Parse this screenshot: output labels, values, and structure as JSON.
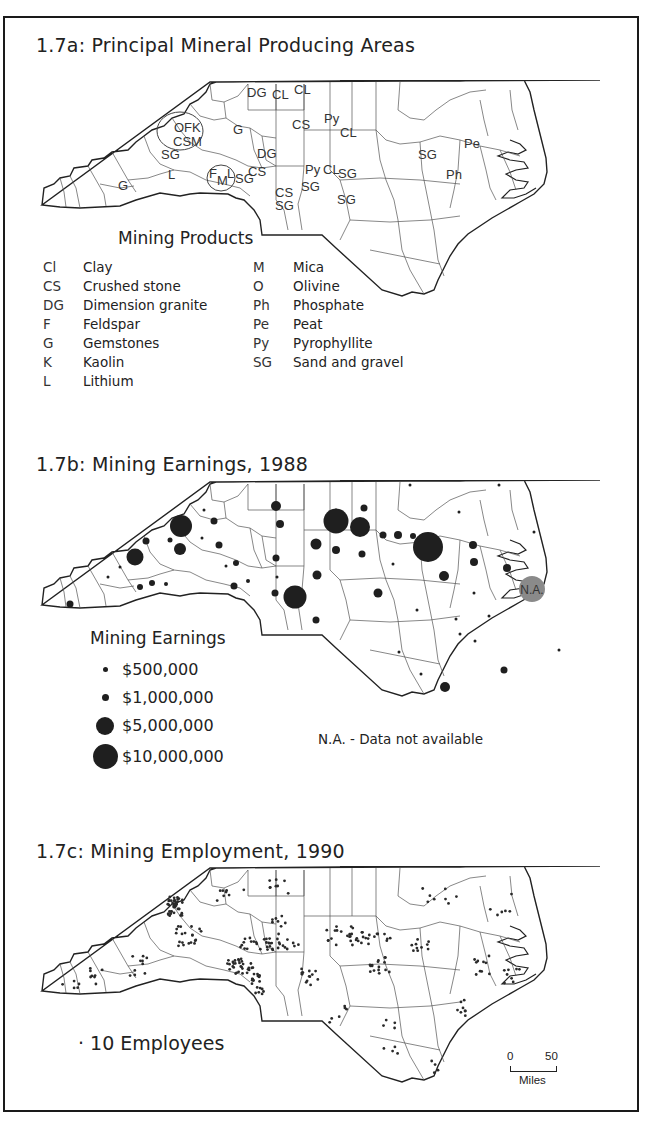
{
  "panels": {
    "a": {
      "title": "1.7a: Principal Mineral Producing Areas",
      "legend_title": "Mining Products",
      "legend_left": [
        {
          "code": "Cl",
          "label": "Clay"
        },
        {
          "code": "CS",
          "label": "Crushed stone"
        },
        {
          "code": "DG",
          "label": "Dimension granite"
        },
        {
          "code": "F",
          "label": "Feldspar"
        },
        {
          "code": "G",
          "label": "Gemstones"
        },
        {
          "code": "K",
          "label": "Kaolin"
        },
        {
          "code": "L",
          "label": "Lithium"
        }
      ],
      "legend_right": [
        {
          "code": "M",
          "label": "Mica"
        },
        {
          "code": "O",
          "label": "Olivine"
        },
        {
          "code": "Ph",
          "label": "Phosphate"
        },
        {
          "code": "Pe",
          "label": "Peat"
        },
        {
          "code": "Py",
          "label": "Pyrophyllite"
        },
        {
          "code": "SG",
          "label": "Sand and gravel"
        }
      ],
      "map_labels": [
        {
          "text": "DG",
          "x": 207,
          "y": 17
        },
        {
          "text": "CL",
          "x": 232,
          "y": 19
        },
        {
          "text": "CL",
          "x": 254,
          "y": 14
        },
        {
          "text": "CS",
          "x": 252,
          "y": 49
        },
        {
          "text": "Py",
          "x": 284,
          "y": 43
        },
        {
          "text": "CL",
          "x": 300,
          "y": 57
        },
        {
          "text": "G",
          "x": 193,
          "y": 54
        },
        {
          "text": "OFK",
          "x": 134,
          "y": 52
        },
        {
          "text": "CSM",
          "x": 133,
          "y": 66
        },
        {
          "text": "SG",
          "x": 121,
          "y": 79
        },
        {
          "text": "DG",
          "x": 217,
          "y": 78
        },
        {
          "text": "L",
          "x": 128,
          "y": 99
        },
        {
          "text": "F",
          "x": 169,
          "y": 98
        },
        {
          "text": "M",
          "x": 177,
          "y": 105
        },
        {
          "text": "L",
          "x": 187,
          "y": 98
        },
        {
          "text": "SG",
          "x": 195,
          "y": 103
        },
        {
          "text": "CS",
          "x": 208,
          "y": 96
        },
        {
          "text": "G",
          "x": 78,
          "y": 110
        },
        {
          "text": "Py",
          "x": 265,
          "y": 94
        },
        {
          "text": "CL",
          "x": 283,
          "y": 94
        },
        {
          "text": "SG",
          "x": 298,
          "y": 98
        },
        {
          "text": "SG",
          "x": 261,
          "y": 111
        },
        {
          "text": "CS",
          "x": 235,
          "y": 117
        },
        {
          "text": "SG",
          "x": 235,
          "y": 130
        },
        {
          "text": "SG",
          "x": 297,
          "y": 124
        },
        {
          "text": "SG",
          "x": 378,
          "y": 79
        },
        {
          "text": "Pe",
          "x": 424,
          "y": 68
        },
        {
          "text": "Ph",
          "x": 406,
          "y": 99
        }
      ]
    },
    "b": {
      "title": "1.7b: Mining Earnings, 1988",
      "legend_title": "Mining Earnings",
      "legend": [
        {
          "label": "$500,000",
          "size": 5
        },
        {
          "label": "$1,000,000",
          "size": 7
        },
        {
          "label": "$5,000,000",
          "size": 18
        },
        {
          "label": "$10,000,000",
          "size": 25
        }
      ],
      "na_label": "N.A.",
      "note": "N.A. - Data not available"
    },
    "c": {
      "title": "1.7c: Mining Employment, 1990",
      "legend": "· 10 Employees",
      "scale": {
        "zero": "0",
        "fifty": "50",
        "unit": "Miles"
      }
    }
  },
  "chart_data": [
    {
      "type": "table",
      "title": "1.7a: Principal Mineral Producing Areas",
      "legend_title": "Mining Products",
      "codes": {
        "Cl": "Clay",
        "CS": "Crushed stone",
        "DG": "Dimension granite",
        "F": "Feldspar",
        "G": "Gemstones",
        "K": "Kaolin",
        "L": "Lithium",
        "M": "Mica",
        "O": "Olivine",
        "Ph": "Phosphate",
        "Pe": "Peat",
        "Py": "Pyrophyllite",
        "SG": "Sand and gravel"
      }
    },
    {
      "type": "scatter",
      "title": "1.7b: Mining Earnings, 1988",
      "legend_title": "Mining Earnings",
      "legend_entries": [
        "$500,000",
        "$1,000,000",
        "$5,000,000",
        "$10,000,000"
      ],
      "annotation": "N.A. - Data not available",
      "points": [
        {
          "x": 30,
          "y": 124,
          "r": 3.5
        },
        {
          "x": 106,
          "y": 61,
          "r": 3.5
        },
        {
          "x": 130,
          "y": 60,
          "r": 2.5
        },
        {
          "x": 100,
          "y": 107,
          "r": 3
        },
        {
          "x": 112,
          "y": 103,
          "r": 3
        },
        {
          "x": 126,
          "y": 104,
          "r": 2
        },
        {
          "x": 80,
          "y": 87,
          "r": 1.5
        },
        {
          "x": 68,
          "y": 97,
          "r": 1.5
        },
        {
          "x": 95,
          "y": 77,
          "r": 8.5
        },
        {
          "x": 141,
          "y": 46,
          "r": 11
        },
        {
          "x": 140,
          "y": 69,
          "r": 6
        },
        {
          "x": 164,
          "y": 30,
          "r": 1.5
        },
        {
          "x": 174,
          "y": 41,
          "r": 3.5
        },
        {
          "x": 162,
          "y": 58,
          "r": 1.5
        },
        {
          "x": 179,
          "y": 65,
          "r": 3.5
        },
        {
          "x": 186,
          "y": 86,
          "r": 1.5
        },
        {
          "x": 196,
          "y": 83,
          "r": 3
        },
        {
          "x": 208,
          "y": 101,
          "r": 2
        },
        {
          "x": 194,
          "y": 106,
          "r": 3.5
        },
        {
          "x": 236,
          "y": 26,
          "r": 5
        },
        {
          "x": 240,
          "y": 44,
          "r": 4
        },
        {
          "x": 236,
          "y": 78,
          "r": 3.5
        },
        {
          "x": 237,
          "y": 97,
          "r": 1.5
        },
        {
          "x": 235,
          "y": 113,
          "r": 3.5
        },
        {
          "x": 255,
          "y": 117,
          "r": 11.5
        },
        {
          "x": 276,
          "y": 64,
          "r": 5.5
        },
        {
          "x": 277,
          "y": 95,
          "r": 4.5
        },
        {
          "x": 276,
          "y": 140,
          "r": 3.5
        },
        {
          "x": 296,
          "y": 30,
          "r": 1.5
        },
        {
          "x": 296,
          "y": 41,
          "r": 12.5
        },
        {
          "x": 320,
          "y": 47,
          "r": 10
        },
        {
          "x": 296,
          "y": 70,
          "r": 4
        },
        {
          "x": 322,
          "y": 74,
          "r": 3.5
        },
        {
          "x": 324,
          "y": 28,
          "r": 3.5
        },
        {
          "x": 343,
          "y": 55,
          "r": 3.5
        },
        {
          "x": 358,
          "y": 55,
          "r": 4
        },
        {
          "x": 373,
          "y": 56,
          "r": 3
        },
        {
          "x": 338,
          "y": 113,
          "r": 4.5
        },
        {
          "x": 353,
          "y": 84,
          "r": 1.5
        },
        {
          "x": 388,
          "y": 67,
          "r": 15
        },
        {
          "x": 404,
          "y": 96,
          "r": 5
        },
        {
          "x": 433,
          "y": 65,
          "r": 4
        },
        {
          "x": 434,
          "y": 82,
          "r": 4
        },
        {
          "x": 467,
          "y": 88,
          "r": 4
        },
        {
          "x": 370,
          "y": 5,
          "r": 1.5
        },
        {
          "x": 419,
          "y": 32,
          "r": 1.5
        },
        {
          "x": 459,
          "y": 5,
          "r": 1.5
        },
        {
          "x": 494,
          "y": 52,
          "r": 1.5
        },
        {
          "x": 434,
          "y": 113,
          "r": 1.5
        },
        {
          "x": 449,
          "y": 136,
          "r": 1.5
        },
        {
          "x": 416,
          "y": 139,
          "r": 1.5
        },
        {
          "x": 377,
          "y": 130,
          "r": 1.5
        },
        {
          "x": 359,
          "y": 172,
          "r": 1.5
        },
        {
          "x": 381,
          "y": 194,
          "r": 1.5
        },
        {
          "x": 405,
          "y": 207,
          "r": 5
        },
        {
          "x": 464,
          "y": 190,
          "r": 3.5
        },
        {
          "x": 420,
          "y": 154,
          "r": 1.5
        },
        {
          "x": 435,
          "y": 161,
          "r": 1.5
        },
        {
          "x": 519,
          "y": 170,
          "r": 1.5
        }
      ],
      "na": {
        "x": 492,
        "y": 109,
        "r": 13
      }
    },
    {
      "type": "scatter",
      "title": "1.7c: Mining Employment, 1990",
      "legend_entries": [
        "10 Employees"
      ],
      "scale": {
        "min": 0,
        "max": 50,
        "unit": "Miles"
      }
    }
  ]
}
